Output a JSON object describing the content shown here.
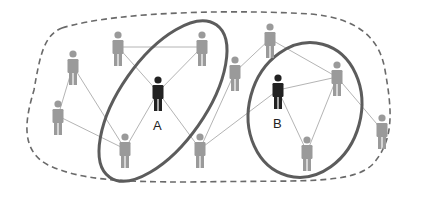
{
  "diagram": {
    "type": "social-network",
    "colors": {
      "background": "#ffffff",
      "person_regular": "#9a9a9a",
      "person_highlight": "#222222",
      "edge": "#b4b4b4",
      "group_ring": "#5c5c5c",
      "boundary": "#6a6a6a"
    },
    "nodes": [
      {
        "id": "n1",
        "label": "",
        "highlight": false
      },
      {
        "id": "n2",
        "label": "",
        "highlight": false
      },
      {
        "id": "n3",
        "label": "",
        "highlight": false
      },
      {
        "id": "A",
        "label": "A",
        "highlight": true
      },
      {
        "id": "n5",
        "label": "",
        "highlight": false
      },
      {
        "id": "n6",
        "label": "",
        "highlight": false
      },
      {
        "id": "n7",
        "label": "",
        "highlight": false
      },
      {
        "id": "n8",
        "label": "",
        "highlight": false
      },
      {
        "id": "n9",
        "label": "",
        "highlight": false
      },
      {
        "id": "B",
        "label": "B",
        "highlight": true
      },
      {
        "id": "n11",
        "label": "",
        "highlight": false
      },
      {
        "id": "n12",
        "label": "",
        "highlight": false
      },
      {
        "id": "n13",
        "label": "",
        "highlight": false
      }
    ],
    "edges": [
      [
        "n2",
        "n3"
      ],
      [
        "n2",
        "A"
      ],
      [
        "n3",
        "A"
      ],
      [
        "A",
        "n6"
      ],
      [
        "A",
        "n7"
      ],
      [
        "n1",
        "n5"
      ],
      [
        "n1",
        "n6"
      ],
      [
        "n5",
        "n6"
      ],
      [
        "n8",
        "n9"
      ],
      [
        "n8",
        "n7"
      ],
      [
        "n9",
        "n11"
      ],
      [
        "n7",
        "B"
      ],
      [
        "B",
        "n11"
      ],
      [
        "B",
        "n12"
      ],
      [
        "n11",
        "n12"
      ],
      [
        "n11",
        "n13"
      ]
    ],
    "groups": [
      {
        "id": "group-A",
        "members": [
          "n2",
          "n3",
          "A",
          "n6"
        ]
      },
      {
        "id": "group-B",
        "members": [
          "B",
          "n11",
          "n12"
        ]
      }
    ],
    "labels": {
      "A": "A",
      "B": "B"
    }
  }
}
